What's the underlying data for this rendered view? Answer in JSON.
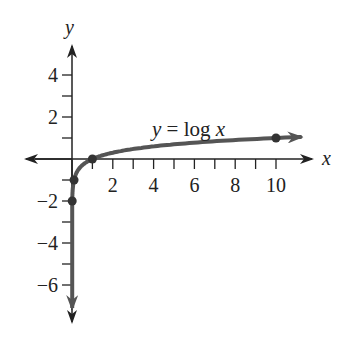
{
  "chart_data": {
    "type": "line",
    "title": "",
    "xlabel": "x",
    "ylabel": "y",
    "annotation": "y = log x",
    "function": "log10(x)",
    "xlim": [
      -1.5,
      12
    ],
    "ylim": [
      -7.5,
      5.5
    ],
    "x_tick_labels": [
      "2",
      "4",
      "6",
      "8",
      "10"
    ],
    "x_ticks": [
      1,
      2,
      3,
      4,
      5,
      6,
      7,
      8,
      9,
      10
    ],
    "y_tick_labels": [
      "4",
      "2",
      "−2",
      "−4",
      "−6"
    ],
    "y_ticks": [
      4,
      3,
      2,
      1,
      -1,
      -2,
      -3,
      -4,
      -5,
      -6
    ],
    "highlighted_points": [
      {
        "x": 0.01,
        "y": -2
      },
      {
        "x": 0.1,
        "y": -1
      },
      {
        "x": 1,
        "y": 0
      },
      {
        "x": 10,
        "y": 1
      }
    ],
    "grid": false,
    "legend": "none",
    "curve_color": "#555555",
    "axis_color": "#222222"
  },
  "labels": {
    "x_axis": "x",
    "y_axis": "y",
    "equation_lhs": "y",
    "equation_eq": " = log ",
    "equation_var": "x"
  }
}
